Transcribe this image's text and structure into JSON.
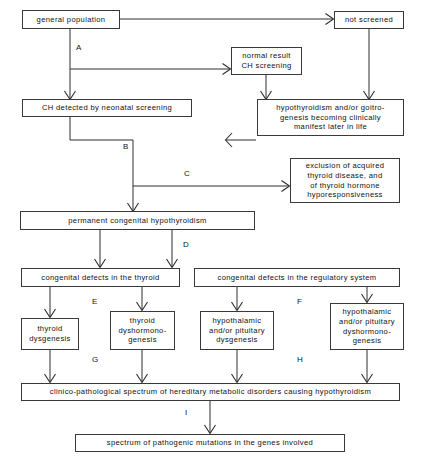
{
  "diagram": {
    "background_color": "#ffffff",
    "line_color": "#2e2e2e",
    "text_color": "#111111",
    "nodes": {
      "general_population": "general population",
      "not_screened": "not screened",
      "normal_result": "normal result\nCH screening",
      "ch_detected": "CH detected by neonatal screening",
      "hypothyroidism_later": "hypothyroidism and/or goitro-\ngenesis becoming clinically\nmanifest later in life",
      "exclusion": "exclusion of acquired\nthyroid disease, and\nof thyroid hormone\nhyporesponsiveness",
      "permanent_ch": "permanent congenital hypothyroidism",
      "defects_thyroid": "congenital defects in the thyroid",
      "defects_regulatory": "congenital defects in the regulatory system",
      "thyroid_dysgenesis": "thyroid\ndysgenesis",
      "thyroid_dyshormonogenesis": "thyroid\ndyshormono-\ngenesis",
      "hyp_pit_dysgenesis": "hypothalamic\nand/or pituitary\ndysgenesis",
      "hyp_pit_dyshormonogenesis": "hypothalamic\nand/or pituitary\ndyshormono-\ngenesis",
      "clinico_pathological": "clinico-pathological spectrum of hereditary metabolic disorders causing hypothyroidism",
      "pathogenic_mutations": "spectrum of pathogenic mutations in the genes involved"
    },
    "edge_labels": {
      "a": "A",
      "b": "B",
      "c": "C",
      "d": "D",
      "e": "E",
      "f": "F",
      "g": "G",
      "h": "H",
      "i": "I"
    }
  }
}
